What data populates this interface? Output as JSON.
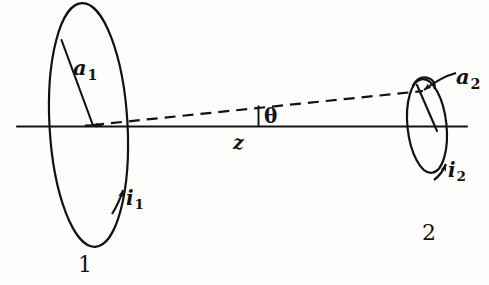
{
  "figure": {
    "kind": "physics-diagram",
    "background_color": "#fdfdfc",
    "ink_color": "#121212",
    "labels": {
      "radius_1": {
        "base": "a",
        "sub": "1"
      },
      "radius_2": {
        "base": "a",
        "sub": "2"
      },
      "current_1": {
        "base": "i",
        "sub": "1"
      },
      "current_2": {
        "base": "i",
        "sub": "2"
      },
      "separation": "z",
      "angle": "θ",
      "loop_1_number": "1",
      "loop_2_number": "2"
    },
    "elements": [
      {
        "name": "axis-line",
        "style": "solid",
        "orientation": "horizontal"
      },
      {
        "name": "loop-1",
        "style": "solid",
        "shape": "ellipse",
        "size": "large"
      },
      {
        "name": "loop-2",
        "style": "solid",
        "shape": "ellipse",
        "size": "small"
      },
      {
        "name": "separation-line",
        "style": "dashed",
        "from": "loop-1-center",
        "to": "loop-2-center"
      },
      {
        "name": "angle-tick",
        "style": "solid",
        "orientation": "vertical"
      },
      {
        "name": "radius-1-line",
        "style": "solid"
      },
      {
        "name": "radius-2-line",
        "style": "solid"
      },
      {
        "name": "current-1-arrow",
        "style": "arrowhead"
      },
      {
        "name": "current-2-arrow",
        "style": "arrowhead"
      },
      {
        "name": "radius-2-pointer-arrow",
        "style": "arrowhead"
      }
    ]
  }
}
